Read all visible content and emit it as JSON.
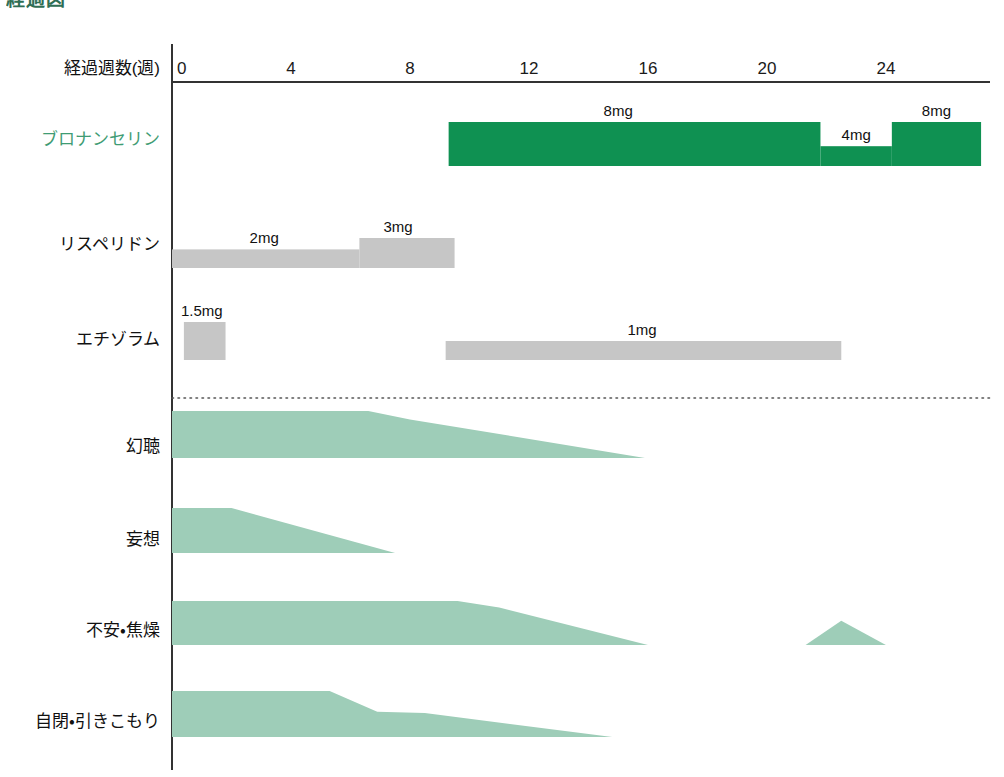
{
  "title": "経過図",
  "axis": {
    "label": "経過週数(週)",
    "unit": "週",
    "ticks": [
      0,
      4,
      8,
      12,
      16,
      20,
      24
    ],
    "range": [
      0,
      27.5
    ]
  },
  "colors": {
    "drug_accent": "#0f9152",
    "drug_accent_label": "#3f9c74",
    "drug_neutral": "#c6c6c6",
    "symptom": "#9ecdb8",
    "axis": "#333333",
    "text": "#111111"
  },
  "chart_data": {
    "type": "timeline",
    "title": "経過図",
    "xlabel": "経過週数(週)",
    "ylabel": "",
    "xlim": [
      0,
      27.5
    ],
    "grid": false,
    "legend": null,
    "x_ticks": [
      0,
      4,
      8,
      12,
      16,
      20,
      24
    ],
    "medication_rows": [
      {
        "name": "ブロナンセリン",
        "accent": true,
        "segments": [
          {
            "dose": "8mg",
            "start_week": 9.3,
            "end_week": 21.8,
            "level": 1.0,
            "label": "8mg",
            "label_week": 15.0
          },
          {
            "dose": "4mg",
            "start_week": 21.8,
            "end_week": 24.2,
            "level": 0.45,
            "label": "4mg",
            "label_week": 23.0
          },
          {
            "dose": "8mg",
            "start_week": 24.2,
            "end_week": 27.2,
            "level": 1.0,
            "label": "8mg",
            "label_week": 25.7
          }
        ]
      },
      {
        "name": "リスペリドン",
        "accent": false,
        "segments": [
          {
            "dose": "2mg",
            "start_week": 0.0,
            "end_week": 6.3,
            "level": 0.62,
            "label": "2mg",
            "label_week": 3.1
          },
          {
            "dose": "3mg",
            "start_week": 6.3,
            "end_week": 9.5,
            "level": 1.0,
            "label": "3mg",
            "label_week": 7.6
          }
        ]
      },
      {
        "name": "エチゾラム",
        "accent": false,
        "segments": [
          {
            "dose": "1.5mg",
            "start_week": 0.4,
            "end_week": 1.8,
            "level": 1.0,
            "label": "1.5mg",
            "label_week": 1.0
          },
          {
            "dose": "1mg",
            "start_week": 9.2,
            "end_week": 22.5,
            "level": 0.5,
            "label": "1mg",
            "label_week": 15.8
          }
        ]
      }
    ],
    "symptom_rows": [
      {
        "name": "幻聴",
        "points": [
          {
            "week": 0.0,
            "severity": 1.0
          },
          {
            "week": 6.6,
            "severity": 1.0
          },
          {
            "week": 8.0,
            "severity": 0.82
          },
          {
            "week": 15.9,
            "severity": 0.0
          }
        ]
      },
      {
        "name": "妄想",
        "points": [
          {
            "week": 0.0,
            "severity": 1.0
          },
          {
            "week": 2.0,
            "severity": 1.0
          },
          {
            "week": 7.5,
            "severity": 0.0
          }
        ]
      },
      {
        "name": "不安・焦燥",
        "points": [
          {
            "week": 0.0,
            "severity": 1.0
          },
          {
            "week": 9.6,
            "severity": 1.0
          },
          {
            "week": 11.0,
            "severity": 0.85
          },
          {
            "week": 16.0,
            "severity": 0.0
          }
        ],
        "extra_peaks": [
          {
            "start_week": 21.3,
            "peak_week": 22.5,
            "end_week": 24.0,
            "severity": 0.55
          }
        ]
      },
      {
        "name": "自閉・引きこもり",
        "points": [
          {
            "week": 0.0,
            "severity": 1.0
          },
          {
            "week": 5.3,
            "severity": 1.0
          },
          {
            "week": 6.9,
            "severity": 0.55
          },
          {
            "week": 8.5,
            "severity": 0.52
          },
          {
            "week": 14.8,
            "severity": 0.0
          }
        ]
      }
    ]
  }
}
